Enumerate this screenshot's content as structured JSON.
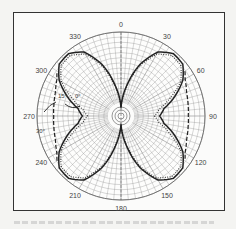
{
  "figure": {
    "type": "polar radiation pattern",
    "angle_labels": [
      {
        "deg": 0,
        "text": "0"
      },
      {
        "deg": 30,
        "text": "30"
      },
      {
        "deg": 60,
        "text": "60"
      },
      {
        "deg": 90,
        "text": "90"
      },
      {
        "deg": 120,
        "text": "120"
      },
      {
        "deg": 150,
        "text": "150"
      },
      {
        "deg": 180,
        "text": "180"
      },
      {
        "deg": 210,
        "text": "210"
      },
      {
        "deg": 240,
        "text": "240"
      },
      {
        "deg": 270,
        "text": "270"
      },
      {
        "deg": 300,
        "text": "300"
      },
      {
        "deg": 330,
        "text": "330"
      }
    ],
    "annotations": [
      {
        "text": "0°",
        "x": 75,
        "y": 98
      },
      {
        "text": "15°",
        "x": 58,
        "y": 98
      },
      {
        "text": "30°",
        "x": 36,
        "y": 133
      }
    ],
    "colors": {
      "line": "#222222",
      "grid": "#8a8a8a",
      "frame": "#333333"
    },
    "curves": [
      {
        "name": "solid",
        "style": "solid",
        "quadrant_angles": [
          0,
          10,
          20,
          30,
          40,
          50,
          60,
          70,
          80,
          90
        ],
        "radii": [
          0.1,
          0.35,
          0.65,
          0.88,
          0.97,
          0.96,
          0.85,
          0.68,
          0.52,
          0.46
        ]
      },
      {
        "name": "dotted",
        "style": "dotted",
        "quadrant_angles": [
          0,
          10,
          20,
          30,
          40,
          50,
          60,
          70,
          80,
          90
        ],
        "radii": [
          0.09,
          0.32,
          0.62,
          0.85,
          0.94,
          0.93,
          0.82,
          0.62,
          0.46,
          0.4
        ]
      },
      {
        "name": "dashed",
        "style": "dashed",
        "quadrant_angles": [
          55,
          60,
          70,
          80,
          90
        ],
        "radii": [
          0.93,
          0.88,
          0.83,
          0.81,
          0.8
        ]
      }
    ]
  }
}
